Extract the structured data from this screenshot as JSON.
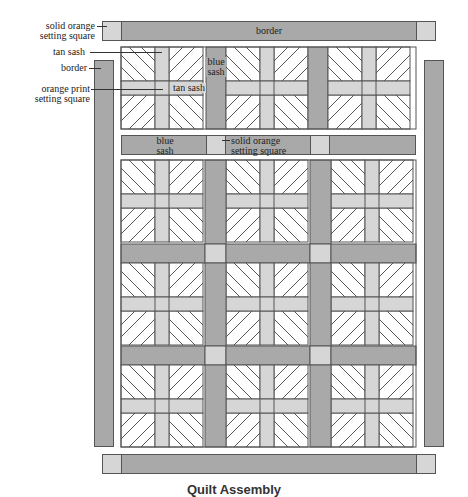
{
  "caption": "Quilt Assembly",
  "labels": {
    "solid_orange_1": "solid orange",
    "solid_orange_2": "setting square",
    "tan_sash": "tan sash",
    "border_left": "border",
    "orange_print_1": "orange print",
    "orange_print_2": "setting square",
    "border_top": "border",
    "blue_sash_vert_1": "blue",
    "blue_sash_vert_2": "sash",
    "tan_sash_inline": "tan sash",
    "blue_sash_row_1": "blue",
    "blue_sash_row_2": "sash",
    "solid_orange_row_1": "solid orange",
    "solid_orange_row_2": "setting square"
  },
  "colors": {
    "blue_sash": "#a9a9a9",
    "tan_sash": "#d6d6d6",
    "outline": "#555555",
    "block_bg": "#ffffff"
  },
  "layout": {
    "block_grid": {
      "columns": 3,
      "rows": 3,
      "top_row_columns": 2
    }
  }
}
